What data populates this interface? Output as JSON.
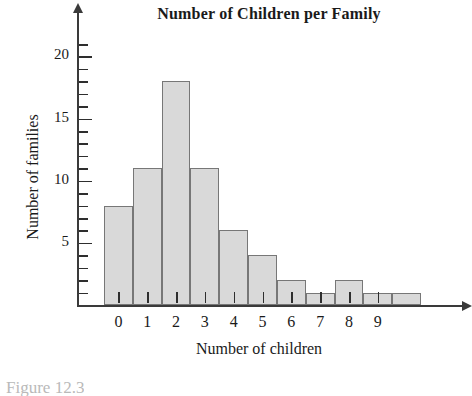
{
  "chart_data": {
    "type": "bar",
    "title": "Number of Children per Family",
    "xlabel": "Number of children",
    "ylabel": "Number of families",
    "categories": [
      "0",
      "1",
      "2",
      "3",
      "4",
      "5",
      "6",
      "7",
      "8",
      "9",
      ""
    ],
    "values": [
      8,
      11,
      18,
      11,
      6,
      4,
      2,
      1,
      2,
      1,
      1
    ],
    "xtick_labels": [
      "0",
      "1",
      "2",
      "3",
      "4",
      "5",
      "6",
      "7",
      "8",
      "9"
    ],
    "ytick_labels": [
      "5",
      "10",
      "15",
      "20"
    ],
    "ytick_values": [
      5,
      10,
      15,
      20
    ],
    "yminor_step": 1,
    "ylim": [
      0,
      21
    ],
    "xlim": [
      0,
      11
    ],
    "grid": false,
    "legend": null,
    "bar_fill_color": "#d9d9d9",
    "bar_border_color": "#777777",
    "axis_color": "#3a3a3a",
    "text_color": "#1a1a1a"
  },
  "figure": {
    "caption": "Figure 12.3"
  }
}
